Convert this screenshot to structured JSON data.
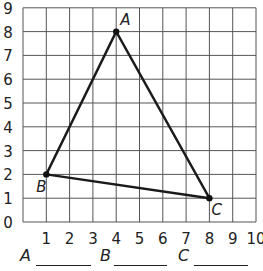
{
  "chart_data": {
    "type": "scatter",
    "title": "",
    "xlabel": "",
    "ylabel": "",
    "xlim": [
      0,
      10
    ],
    "ylim": [
      0,
      9
    ],
    "grid": true,
    "x_ticks": [
      "1",
      "2",
      "3",
      "4",
      "5",
      "6",
      "7",
      "8",
      "9",
      "10"
    ],
    "y_ticks": [
      "0",
      "1",
      "2",
      "3",
      "4",
      "5",
      "6",
      "7",
      "8",
      "9"
    ],
    "points": [
      {
        "label": "A",
        "x": 4,
        "y": 8
      },
      {
        "label": "B",
        "x": 1,
        "y": 2
      },
      {
        "label": "C",
        "x": 8,
        "y": 1
      }
    ],
    "shape": "triangle ABC"
  },
  "answers": {
    "a_label": "A",
    "b_label": "B",
    "c_label": "C",
    "a_value": "",
    "b_value": "",
    "c_value": ""
  }
}
